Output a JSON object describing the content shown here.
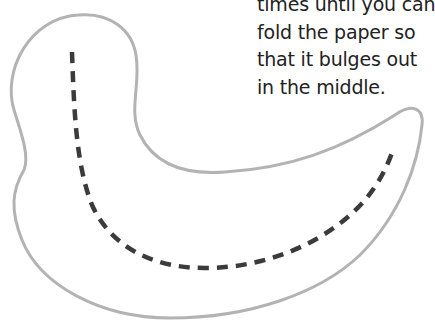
{
  "instructions": {
    "lines": [
      "times until you can",
      "fold the paper so",
      "that it bulges out",
      "in the middle."
    ]
  },
  "shape": {
    "outline_color": "#b3b3b3",
    "fold_line_color": "#3b3b3b",
    "fold_line_style": "dashed"
  }
}
